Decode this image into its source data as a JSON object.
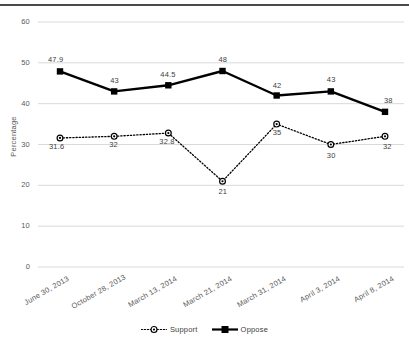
{
  "chart_data": {
    "type": "line",
    "title": "",
    "xlabel": "",
    "ylabel": "Percentage",
    "ylim": [
      0,
      60
    ],
    "yticks": [
      0,
      10,
      20,
      30,
      40,
      50,
      60
    ],
    "grid": true,
    "legend_position": "bottom",
    "categories": [
      "June 30, 2013",
      "October 28, 2013",
      "March 13, 2014",
      "March 21, 2014",
      "March 31, 2014",
      "April 3, 2014",
      "April 8, 2014"
    ],
    "series": [
      {
        "name": "Support",
        "marker": "circle",
        "line_style": "dotted",
        "color": "#000000",
        "values": [
          31.6,
          32,
          32.8,
          21,
          35,
          30,
          32
        ],
        "labels": [
          "31.6",
          "32",
          "32.8",
          "21",
          "35",
          "30",
          "32"
        ]
      },
      {
        "name": "Oppose",
        "marker": "square",
        "line_style": "solid",
        "color": "#000000",
        "values": [
          47.9,
          43,
          44.5,
          48,
          42,
          43,
          38
        ],
        "labels": [
          "47.9",
          "43",
          "44.5",
          "48",
          "42",
          "43",
          "38"
        ]
      }
    ]
  },
  "axis": {
    "ytick_labels": [
      "60",
      "50",
      "40",
      "30",
      "20",
      "10",
      "0"
    ],
    "ylabel": "Percentage"
  },
  "legend": {
    "items": [
      {
        "label": "Support"
      },
      {
        "label": "Oppose"
      }
    ]
  }
}
